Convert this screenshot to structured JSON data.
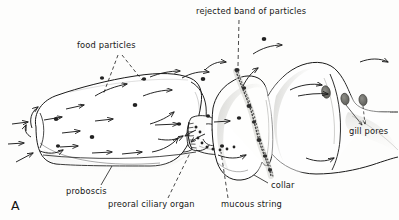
{
  "figure": {
    "panel_letter": "A",
    "background_color": "#fdfdfc",
    "ink_color": "#1a1a1a"
  },
  "labels": {
    "food_particles": "food particles",
    "rejected_band": "rejected band of particles",
    "gill_pores": "gill pores",
    "proboscis": "proboscis",
    "preoral_ciliary_organ": "preoral ciliary organ",
    "mucous_string": "mucous string",
    "collar": "collar"
  },
  "anatomy": {
    "parts": [
      {
        "name": "proboscis",
        "label": "proboscis"
      },
      {
        "name": "preoral-ciliary-organ",
        "label": "preoral ciliary organ"
      },
      {
        "name": "collar",
        "label": "collar"
      },
      {
        "name": "trunk",
        "label": ""
      },
      {
        "name": "gill-pores",
        "label": "gill pores"
      }
    ]
  },
  "features": {
    "food_particles_count": 12,
    "gill_pore_count": 3,
    "current_arrow_count": 26,
    "mucous_string_description": "wavy chain of dark particles running down the collar"
  }
}
